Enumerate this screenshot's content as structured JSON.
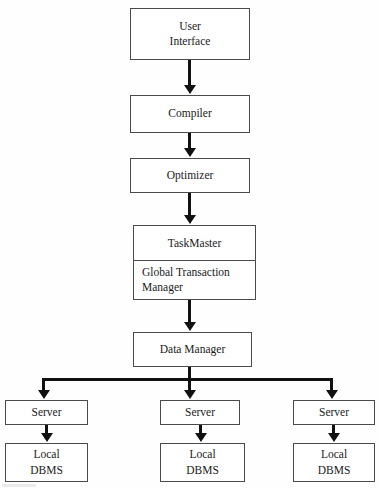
{
  "diagram": {
    "nodes": {
      "user_interface": {
        "line1": "User",
        "line2": "Interface"
      },
      "compiler": {
        "label": "Compiler"
      },
      "optimizer": {
        "label": "Optimizer"
      },
      "taskmaster": {
        "label": "TaskMaster"
      },
      "global_transaction_manager": {
        "line1": "Global Transaction",
        "line2": "Manager"
      },
      "data_manager": {
        "label": "Data Manager"
      },
      "server_left": {
        "label": "Server"
      },
      "server_middle": {
        "label": "Server"
      },
      "server_right": {
        "label": "Server"
      },
      "local_dbms_left": {
        "line1": "Local",
        "line2": "DBMS"
      },
      "local_dbms_middle": {
        "line1": "Local",
        "line2": "DBMS"
      },
      "local_dbms_right": {
        "line1": "Local",
        "line2": "DBMS"
      }
    },
    "colors": {
      "box_border": "#4a4a4a",
      "connector": "#111111",
      "background": "#fefefe",
      "text": "#1a1a1a"
    }
  }
}
